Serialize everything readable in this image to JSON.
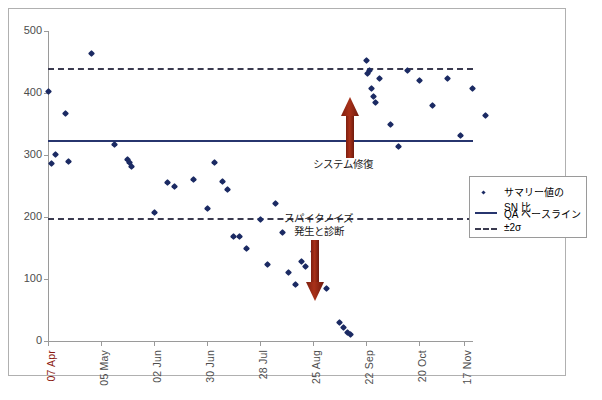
{
  "chart_data": {
    "type": "scatter",
    "title": "",
    "xlabel": "",
    "ylabel": "",
    "ylim": [
      0,
      500
    ],
    "yticks": [
      0,
      100,
      200,
      300,
      400,
      500
    ],
    "grid": false,
    "legend_position": "right-middle",
    "xtick_labels": [
      "07 Apr",
      "05 May",
      "02 Jun",
      "30 Jun",
      "28 Jul",
      "25 Aug",
      "22 Sep",
      "20 Oct",
      "17 Nov"
    ],
    "series": [
      {
        "name": "サマリー値の SN 比",
        "marker": "diamond",
        "color": "#1b2a63",
        "points": [
          {
            "x": "07 Apr",
            "y": 403
          },
          {
            "x": "09 Apr",
            "y": 286
          },
          {
            "x": "11 Apr",
            "y": 301
          },
          {
            "x": "16 Apr",
            "y": 367
          },
          {
            "x": "18 Apr",
            "y": 289
          },
          {
            "x": "30 Apr",
            "y": 464
          },
          {
            "x": "12 May",
            "y": 317
          },
          {
            "x": "19 May",
            "y": 292
          },
          {
            "x": "20 May",
            "y": 288
          },
          {
            "x": "21 May",
            "y": 281
          },
          {
            "x": "02 Jun",
            "y": 208
          },
          {
            "x": "09 Jun",
            "y": 256
          },
          {
            "x": "13 Jun",
            "y": 249
          },
          {
            "x": "23 Jun",
            "y": 261
          },
          {
            "x": "30 Jun",
            "y": 214
          },
          {
            "x": "04 Jul",
            "y": 288
          },
          {
            "x": "08 Jul",
            "y": 257
          },
          {
            "x": "11 Jul",
            "y": 244
          },
          {
            "x": "14 Jul",
            "y": 168
          },
          {
            "x": "17 Jul",
            "y": 169
          },
          {
            "x": "21 Jul",
            "y": 150
          },
          {
            "x": "28 Jul",
            "y": 196
          },
          {
            "x": "01 Aug",
            "y": 124
          },
          {
            "x": "05 Aug",
            "y": 221
          },
          {
            "x": "09 Aug",
            "y": 175
          },
          {
            "x": "12 Aug",
            "y": 110
          },
          {
            "x": "16 Aug",
            "y": 91
          },
          {
            "x": "19 Aug",
            "y": 129
          },
          {
            "x": "21 Aug",
            "y": 120
          },
          {
            "x": "25 Aug",
            "y": 145
          },
          {
            "x": "01 Sep",
            "y": 85
          },
          {
            "x": "08 Sep",
            "y": 30
          },
          {
            "x": "10 Sep",
            "y": 22
          },
          {
            "x": "12 Sep",
            "y": 14
          },
          {
            "x": "14 Sep",
            "y": 10
          },
          {
            "x": "22 Sep",
            "y": 452
          },
          {
            "x": "23 Sep",
            "y": 432
          },
          {
            "x": "24 Sep",
            "y": 437
          },
          {
            "x": "25 Sep",
            "y": 408
          },
          {
            "x": "26 Sep",
            "y": 395
          },
          {
            "x": "27 Sep",
            "y": 384
          },
          {
            "x": "29 Sep",
            "y": 424
          },
          {
            "x": "05 Oct",
            "y": 350
          },
          {
            "x": "09 Oct",
            "y": 313
          },
          {
            "x": "14 Oct",
            "y": 437
          },
          {
            "x": "20 Oct",
            "y": 420
          },
          {
            "x": "27 Oct",
            "y": 380
          },
          {
            "x": "04 Nov",
            "y": 424
          },
          {
            "x": "11 Nov",
            "y": 332
          },
          {
            "x": "17 Nov",
            "y": 408
          },
          {
            "x": "24 Nov",
            "y": 364
          }
        ]
      }
    ],
    "reference_lines": [
      {
        "name": "QA ベースライン",
        "value": 313,
        "style": "solid",
        "color": "#27356e"
      },
      {
        "name": "+2σ",
        "value": 437,
        "style": "dashed",
        "color": "#3a3a4f"
      },
      {
        "name": "-2σ",
        "value": 198,
        "style": "dashed",
        "color": "#3a3a4f"
      }
    ],
    "annotations": [
      {
        "id": "spike-noise",
        "text_line1": "スパイクノイズ",
        "text_line2": "発生と診断",
        "arrow": "down",
        "arrow_color": "#9e2a16",
        "x": "03 Sep",
        "y_from": 195,
        "y_to": 60
      },
      {
        "id": "system-repair",
        "text_line1": "システム修復",
        "text_line2": "",
        "arrow": "up",
        "arrow_color": "#9e2a16",
        "x": "22 Sep",
        "y_from": 295,
        "y_to": 415
      }
    ]
  },
  "legend": {
    "entries": [
      {
        "key": "marker",
        "label_line1": "サマリー値の",
        "label_line2": "SN 比"
      },
      {
        "key": "solid-line",
        "label_line1": "QA ベースライン",
        "label_line2": ""
      },
      {
        "key": "dashed-line",
        "label_line1": "±2σ",
        "label_line2": ""
      }
    ]
  },
  "axes": {
    "y_tick_labels": [
      "500",
      "400",
      "300",
      "200",
      "100",
      "0"
    ],
    "x_tick_labels": [
      "07 Apr",
      "05 May",
      "02 Jun",
      "30 Jun",
      "28 Jul",
      "25 Aug",
      "22 Sep",
      "20 Oct",
      "17 Nov"
    ]
  },
  "colors": {
    "marker": "#1b2a63",
    "baseline": "#27356e",
    "sigma": "#3a3a4f",
    "arrow": "#9e2a16",
    "first_xlabel": "#8b1a10",
    "axis": "#9a9a9a",
    "border": "#b0b0b0"
  }
}
